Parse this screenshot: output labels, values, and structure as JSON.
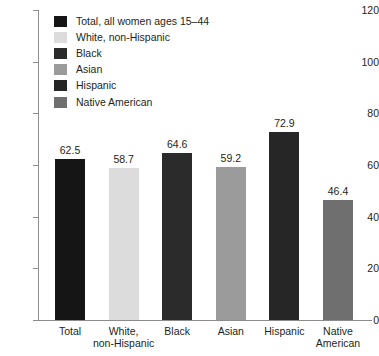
{
  "chart_data": {
    "type": "bar",
    "title": "",
    "xlabel": "",
    "ylabel": "",
    "ylim": [
      0,
      120
    ],
    "yticks": [
      0,
      20,
      40,
      60,
      80,
      100,
      120
    ],
    "grid": false,
    "legend_position": "top-left",
    "categories": [
      "Total",
      "White,\nnon-Hispanic",
      "Black",
      "Asian",
      "Hispanic",
      "Native\nAmerican"
    ],
    "values": [
      62.5,
      58.7,
      64.6,
      59.2,
      72.9,
      46.4
    ],
    "value_labels": [
      "62.5",
      "58.7",
      "64.6",
      "59.2",
      "72.9",
      "46.4"
    ],
    "colors": [
      "#151515",
      "#dcdcdc",
      "#2b2b2b",
      "#9b9b9b",
      "#262626",
      "#6f6f6f"
    ],
    "legend": [
      {
        "label": "Total, all women ages 15–44",
        "color": "#151515"
      },
      {
        "label": "White, non-Hispanic",
        "color": "#dcdcdc"
      },
      {
        "label": "Black",
        "color": "#2b2b2b"
      },
      {
        "label": "Asian",
        "color": "#9b9b9b"
      },
      {
        "label": "Hispanic",
        "color": "#262626"
      },
      {
        "label": "Native American",
        "color": "#6f6f6f"
      }
    ]
  },
  "axis": {
    "tick_labels": [
      "120",
      "100",
      "80",
      "60",
      "40",
      "20",
      "0"
    ]
  },
  "categories_display": [
    {
      "line1": "Total",
      "line2": ""
    },
    {
      "line1": "White,",
      "line2": "non-Hispanic"
    },
    {
      "line1": "Black",
      "line2": ""
    },
    {
      "line1": "Asian",
      "line2": ""
    },
    {
      "line1": "Hispanic",
      "line2": ""
    },
    {
      "line1": "Native",
      "line2": "American"
    }
  ]
}
